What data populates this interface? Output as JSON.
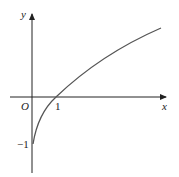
{
  "diagram": {
    "type": "function-graph",
    "axes": {
      "x_label": "x",
      "y_label": "y",
      "origin_label": "O"
    },
    "tick_labels": {
      "x_one": "1",
      "y_neg_one": "−1"
    },
    "curve": {
      "description": "increasing concave curve through (0,-1) and (1,0)",
      "color": "#555555"
    }
  }
}
